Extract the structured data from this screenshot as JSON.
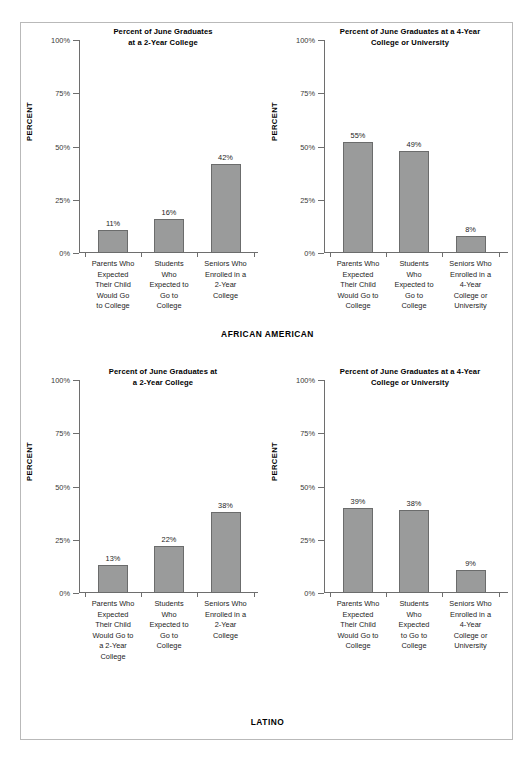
{
  "chart_data": [
    {
      "type": "bar",
      "title": "Percent of June Graduates at a 2-Year College",
      "title_lines": [
        "Percent of June Graduates",
        "at a 2-Year College"
      ],
      "group": "AFRICAN AMERICAN",
      "ylabel": "PERCENT",
      "xlabel": "",
      "ylim": [
        0,
        100
      ],
      "yticks": [
        "0%",
        "25%",
        "50%",
        "75%",
        "100%"
      ],
      "ytick_values": [
        0,
        25,
        50,
        75,
        100
      ],
      "grid": false,
      "legend": "none",
      "categories": [
        "Parents Who Expected Their Child Would Go to College",
        "Students Who Expected to Go to College",
        "Seniors Who Enrolled in a 2-Year College"
      ],
      "category_lines": [
        [
          "Parents Who",
          "Expected",
          "Their Child",
          "Would Go",
          "to College"
        ],
        [
          "Students",
          "Who",
          "Expected to",
          "Go to",
          "College"
        ],
        [
          "Seniors Who",
          "Enrolled in a",
          "2-Year",
          "College"
        ]
      ],
      "values": [
        11,
        16,
        42
      ],
      "value_labels": [
        "11%",
        "16%",
        "42%"
      ],
      "bar_heights_drawn": [
        11,
        16,
        42
      ]
    },
    {
      "type": "bar",
      "title": "Percent of June Graduates at a 4-Year College or University",
      "title_lines": [
        "Percent of June Graduates at a 4-Year",
        "College or University"
      ],
      "group": "AFRICAN AMERICAN",
      "ylabel": "PERCENT",
      "xlabel": "",
      "ylim": [
        0,
        100
      ],
      "yticks": [
        "0%",
        "25%",
        "50%",
        "75%",
        "100%"
      ],
      "ytick_values": [
        0,
        25,
        50,
        75,
        100
      ],
      "grid": false,
      "legend": "none",
      "categories": [
        "Parents Who Expected Their Child Would Go to College",
        "Students Who Expected to Go to College",
        "Seniors Who Enrolled in a 4-Year College or University"
      ],
      "category_lines": [
        [
          "Parents Who",
          "Expected",
          "Their Child",
          "Would Go to",
          "College"
        ],
        [
          "Students",
          "Who",
          "Expected to",
          "Go to",
          "College"
        ],
        [
          "Seniors Who",
          "Enrolled in a",
          "4-Year",
          "College or",
          "University"
        ]
      ],
      "values": [
        55,
        49,
        8
      ],
      "value_labels": [
        "55%",
        "49%",
        "8%"
      ],
      "bar_heights_drawn": [
        52,
        48,
        8
      ]
    },
    {
      "type": "bar",
      "title": "Percent of June Graduates at a 2-Year College",
      "title_lines": [
        "Percent of June Graduates at",
        "a 2-Year College"
      ],
      "group": "LATINO",
      "ylabel": "PERCENT",
      "xlabel": "",
      "ylim": [
        0,
        100
      ],
      "yticks": [
        "0%",
        "25%",
        "50%",
        "75%",
        "100%"
      ],
      "ytick_values": [
        0,
        25,
        50,
        75,
        100
      ],
      "grid": false,
      "legend": "none",
      "categories": [
        "Parents Who Expected Their Child Would Go to a 2-Year College",
        "Students Who Expected to Go to College",
        "Seniors Who Enrolled in a 2-Year College"
      ],
      "category_lines": [
        [
          "Parents Who",
          "Expected",
          "Their Child",
          "Would Go to",
          "a 2-Year",
          "College"
        ],
        [
          "Students",
          "Who",
          "Expected to",
          "Go to",
          "College"
        ],
        [
          "Seniors Who",
          "Enrolled in a",
          "2-Year",
          "College"
        ]
      ],
      "values": [
        13,
        22,
        38
      ],
      "value_labels": [
        "13%",
        "22%",
        "38%"
      ],
      "bar_heights_drawn": [
        13,
        22,
        38
      ]
    },
    {
      "type": "bar",
      "title": "Percent of June Graduates at a 4-Year College or University",
      "title_lines": [
        "Percent of June Graduates at a 4-Year",
        "College or University"
      ],
      "group": "LATINO",
      "ylabel": "PERCENT",
      "xlabel": "",
      "ylim": [
        0,
        100
      ],
      "yticks": [
        "0%",
        "25%",
        "50%",
        "75%",
        "100%"
      ],
      "ytick_values": [
        0,
        25,
        50,
        75,
        100
      ],
      "grid": false,
      "legend": "none",
      "categories": [
        "Parents Who Expected Their Child Would Go to College",
        "Students Who Expected to Go to College",
        "Seniors Who Enrolled in a 4-Year College or University"
      ],
      "category_lines": [
        [
          "Parents Who",
          "Expected",
          "Their Child",
          "Would Go to",
          "College"
        ],
        [
          "Students",
          "Who",
          "Expected",
          "to Go to",
          "College"
        ],
        [
          "Seniors Who",
          "Enrolled in a",
          "4-Year",
          "College or",
          "University"
        ]
      ],
      "values": [
        39,
        38,
        9
      ],
      "value_labels": [
        "39%",
        "38%",
        "9%"
      ],
      "bar_heights_drawn": [
        40,
        39,
        11
      ]
    }
  ],
  "groups": [
    {
      "name": "AFRICAN AMERICAN",
      "charts": [
        0,
        1
      ]
    },
    {
      "name": "LATINO",
      "charts": [
        2,
        3
      ]
    }
  ],
  "colors": {
    "bar_fill": "#9a9b9b",
    "bar_stroke": "#6b6c6c",
    "axis": "#6e6e6e",
    "text": "#1d1d1d",
    "frame_border": "#b9b9b9",
    "background": "#ffffff"
  }
}
